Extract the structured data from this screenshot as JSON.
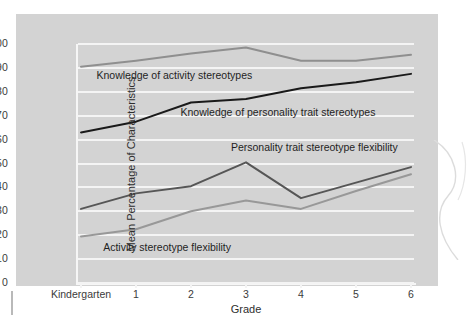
{
  "chart_data": {
    "type": "line",
    "title": "",
    "xlabel": "Grade",
    "ylabel": "Mean Percentage of Characteristics",
    "categories": [
      "Kindergarten",
      "1",
      "2",
      "3",
      "4",
      "5",
      "6"
    ],
    "ylim": [
      0,
      100
    ],
    "ytick_step": 10,
    "yticks": [
      100,
      90,
      80,
      70,
      60,
      50,
      40,
      30,
      20,
      10,
      0
    ],
    "grid": "horizontal",
    "legend_position": "inline-annotations",
    "background_color": "#d3d3d3",
    "gridline_color": "#f4f4f4",
    "series": [
      {
        "name": "Knowledge of activity stereotypes",
        "color": "#8f8f8f",
        "values": [
          90.5,
          93.0,
          96.0,
          98.5,
          93.0,
          93.0,
          95.5
        ]
      },
      {
        "name": "Knowledge of personality trait stereotypes",
        "color": "#1a1a1a",
        "values": [
          63.0,
          67.5,
          75.5,
          77.0,
          81.5,
          84.0,
          87.5
        ]
      },
      {
        "name": "Personality trait stereotype flexibility",
        "color": "#565656",
        "values": [
          31.0,
          37.5,
          40.5,
          50.5,
          35.5,
          42.0,
          48.5
        ]
      },
      {
        "name": "Activity stereotype flexibility",
        "color": "#989898",
        "values": [
          19.5,
          22.5,
          30.0,
          34.5,
          31.0,
          38.5,
          45.5
        ]
      }
    ],
    "annotations": [
      {
        "text": "Knowledge of activity stereotypes",
        "x_frac": 0.055,
        "y_value": 86.5
      },
      {
        "text": "Knowledge of personality trait stereotypes",
        "x_frac": 0.305,
        "y_value": 71.0
      },
      {
        "text": "Personality trait stereotype flexibility",
        "x_frac": 0.455,
        "y_value": 56.5
      },
      {
        "text": "Activity stereotype flexibility",
        "x_frac": 0.075,
        "y_value": 14.5
      }
    ]
  }
}
